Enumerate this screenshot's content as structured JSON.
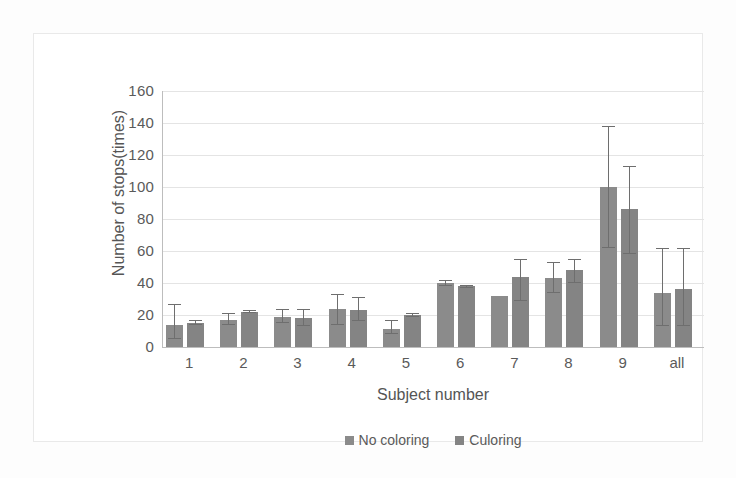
{
  "chart_data": {
    "type": "bar",
    "title": "",
    "xlabel": "Subject number",
    "ylabel": "Number of stops(times)",
    "categories": [
      "1",
      "2",
      "3",
      "4",
      "5",
      "6",
      "7",
      "8",
      "9",
      "all"
    ],
    "ylim": [
      0,
      160
    ],
    "yticks": [
      0,
      20,
      40,
      60,
      80,
      100,
      120,
      140,
      160
    ],
    "grid": true,
    "legend_position": "bottom",
    "series": [
      {
        "name": "No coloring",
        "color": "#8b8b8b",
        "values": [
          14,
          17,
          19,
          24,
          11,
          40,
          32,
          43,
          100,
          34
        ],
        "error_low": [
          5,
          14,
          15,
          14,
          8,
          38,
          32,
          34,
          62,
          13
        ],
        "error_high": [
          27,
          21,
          24,
          33,
          17,
          42,
          32,
          53,
          138,
          62
        ]
      },
      {
        "name": "Coloring",
        "color": "#848484",
        "values": [
          15,
          22,
          18,
          23,
          20,
          38,
          44,
          48,
          86,
          36
        ],
        "error_low": [
          14,
          21,
          13,
          16,
          19,
          37,
          29,
          40,
          58,
          13
        ],
        "error_high": [
          17,
          23,
          24,
          31,
          21,
          39,
          55,
          55,
          113,
          62
        ]
      }
    ]
  },
  "legend": {
    "items": [
      {
        "label": "No coloring"
      },
      {
        "label": "Culoring"
      }
    ]
  },
  "axes": {
    "y_title": "Number of stops(times)",
    "x_title": "Subject number",
    "y_tick_labels": [
      "160",
      "140",
      "120",
      "100",
      "80",
      "60",
      "40",
      "20",
      "0"
    ],
    "x_tick_labels": [
      "1",
      "2",
      "3",
      "4",
      "5",
      "6",
      "7",
      "8",
      "9",
      "all"
    ]
  }
}
